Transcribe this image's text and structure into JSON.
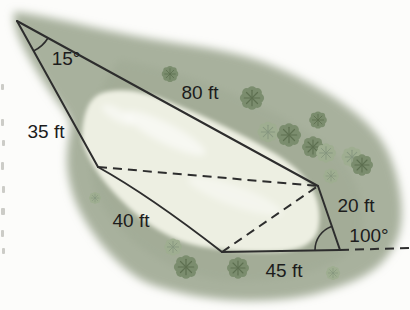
{
  "figure": {
    "type": "pond-survey-geometry-diagram",
    "labels": {
      "angle_top_left": "15°",
      "side_top": "80 ft",
      "side_upper_left": "35 ft",
      "side_lower_left": "40 ft",
      "side_bottom": "45 ft",
      "side_right": "20 ft",
      "angle_bottom_right": "100°"
    },
    "colors": {
      "background": "#fcfcfa",
      "grass": "#a8b19d",
      "grass_shade": "#9aa48e",
      "pond": "#edefe2",
      "pond_highlight": "#ffffff",
      "bush_dark": "#7b8d6e",
      "bush_dark_detail": "#5e7051",
      "bush_light": "#9fae91",
      "bush_light_detail": "#879780",
      "line": "#2d2d2d",
      "text": "#1c1c1c"
    },
    "icons": {
      "bush": "bush-icon",
      "margin_marks": "page-margin-marks"
    }
  }
}
